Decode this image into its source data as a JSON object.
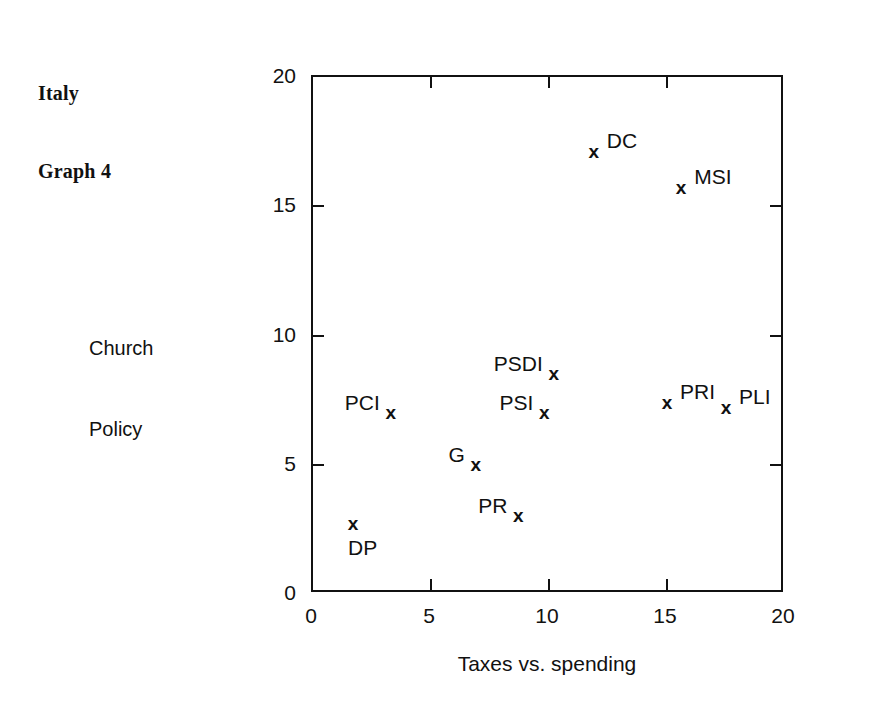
{
  "caption": {
    "line1": "Italy",
    "line2": "Graph 4"
  },
  "chart_data": {
    "type": "scatter",
    "title": "Italy Graph 4",
    "xlabel": "Taxes vs. spending",
    "ylabel": "Church Policy",
    "ylabel_line1": "Church",
    "ylabel_line2": "Policy",
    "xlim": [
      0,
      20
    ],
    "ylim": [
      0,
      20
    ],
    "xticks": [
      0,
      5,
      10,
      15,
      20
    ],
    "yticks": [
      0,
      5,
      10,
      15,
      20
    ],
    "xtick_labels": [
      "0",
      "5",
      "10",
      "15",
      "20"
    ],
    "ytick_labels": [
      "0",
      "5",
      "10",
      "15",
      "20"
    ],
    "grid": false,
    "legend": "none",
    "marker": "x",
    "points": [
      {
        "label": "DC",
        "x": 11.9,
        "y": 17.1,
        "label_pos": "right"
      },
      {
        "label": "MSI",
        "x": 15.6,
        "y": 15.7,
        "label_pos": "right"
      },
      {
        "label": "PSDI",
        "x": 10.2,
        "y": 8.5,
        "label_pos": "left"
      },
      {
        "label": "PSI",
        "x": 9.8,
        "y": 7.0,
        "label_pos": "left"
      },
      {
        "label": "PRI",
        "x": 15.0,
        "y": 7.4,
        "label_pos": "right"
      },
      {
        "label": "PLI",
        "x": 17.5,
        "y": 7.2,
        "label_pos": "right"
      },
      {
        "label": "PCI",
        "x": 3.3,
        "y": 7.0,
        "label_pos": "left"
      },
      {
        "label": "G",
        "x": 6.9,
        "y": 5.0,
        "label_pos": "left"
      },
      {
        "label": "PR",
        "x": 8.7,
        "y": 3.0,
        "label_pos": "left"
      },
      {
        "label": "DP",
        "x": 1.7,
        "y": 2.7,
        "label_pos": "below"
      }
    ]
  }
}
